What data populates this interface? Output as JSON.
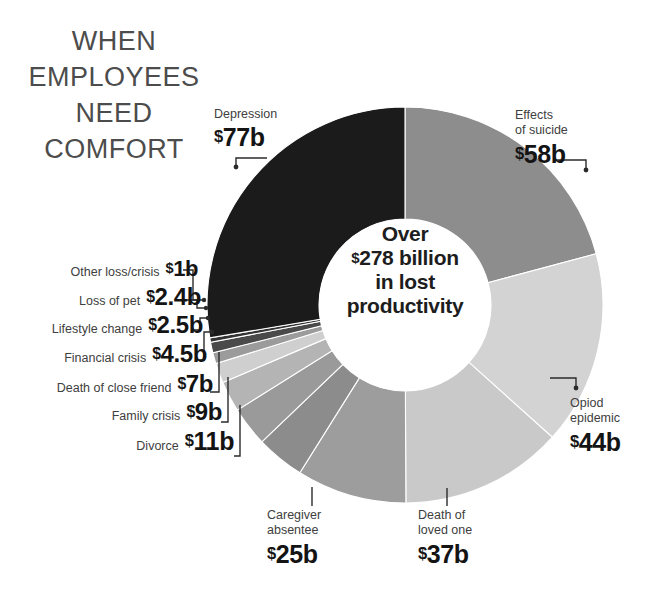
{
  "headline": {
    "lines": [
      "WHEN",
      "EMPLOYEES",
      "NEED",
      "COMFORT"
    ]
  },
  "center": {
    "line1": "Over",
    "line2_currency": "$",
    "line2": "278 billion",
    "line3": "in lost",
    "line4": "productivity"
  },
  "chart_data": {
    "type": "pie",
    "title": "WHEN EMPLOYEES NEED COMFORT",
    "subtitle": "Over $278 billion in lost productivity",
    "unit": "billion USD",
    "total": 278,
    "total_label": "$278 billion",
    "legend": "none",
    "donut": true,
    "start_angle_deg": 0,
    "direction": "clockwise",
    "categories": [
      "Effects of suicide",
      "Opiod epidemic",
      "Death of loved one",
      "Caregiver absentee",
      "Divorce",
      "Family crisis",
      "Death of close friend",
      "Financial crisis",
      "Lifestyle change",
      "Loss of pet",
      "Other loss/crisis",
      "Depression"
    ],
    "values": [
      58,
      44,
      37,
      25,
      11,
      9,
      7,
      4.5,
      2.5,
      2.4,
      1,
      77
    ],
    "value_labels": [
      "$58b",
      "$44b",
      "$37b",
      "$25b",
      "$11b",
      "$9b",
      "$7b",
      "$4.5b",
      "$2.5b",
      "$2.4b",
      "$1b",
      "$77b"
    ],
    "colors": [
      "#8d8d8d",
      "#d3d3d3",
      "#c9c9c9",
      "#9d9d9d",
      "#8c8c8c",
      "#9a9a9a",
      "#b4b4b4",
      "#cfcfcf",
      "#9b9b9b",
      "#4a4a4a",
      "#343434",
      "#1b1b1b"
    ]
  },
  "labels": {
    "depression": {
      "name": "Depression",
      "value_currency": "$",
      "value": "77b"
    },
    "suicide": {
      "name_line1": "Effects",
      "name_line2": "of suicide",
      "value_currency": "$",
      "value": "58b"
    },
    "opioid": {
      "name_line1": "Opiod",
      "name_line2": "epidemic",
      "value_currency": "$",
      "value": "44b"
    },
    "loved_one": {
      "name_line1": "Death of",
      "name_line2": "loved one",
      "value_currency": "$",
      "value": "37b"
    },
    "caregiver": {
      "name_line1": "Caregiver",
      "name_line2": "absentee",
      "value_currency": "$",
      "value": "25b"
    },
    "left_stack": [
      {
        "name": "Other loss/crisis",
        "currency": "$",
        "value": "1b"
      },
      {
        "name": "Loss of pet",
        "currency": "$",
        "value": "2.4b"
      },
      {
        "name": "Lifestyle change",
        "currency": "$",
        "value": "2.5b"
      },
      {
        "name": "Financial crisis",
        "currency": "$",
        "value": "4.5b"
      },
      {
        "name": "Death of close friend",
        "currency": "$",
        "value": "7b"
      },
      {
        "name": "Family crisis",
        "currency": "$",
        "value": "9b"
      },
      {
        "name": "Divorce",
        "currency": "$",
        "value": "11b"
      }
    ]
  }
}
